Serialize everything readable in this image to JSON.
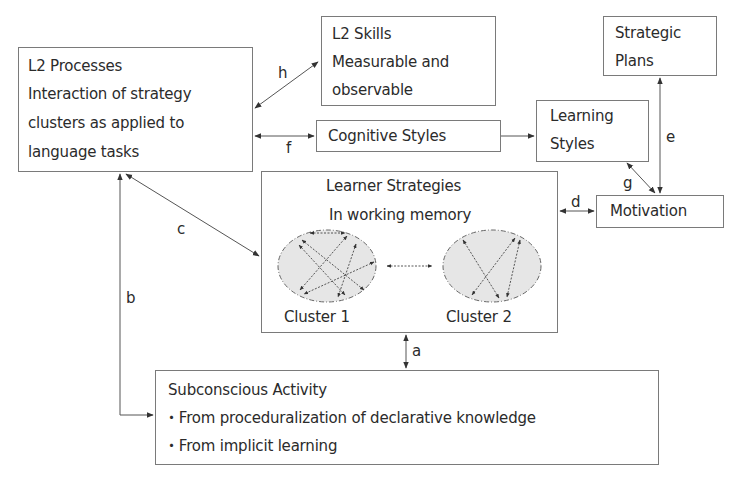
{
  "nodes": {
    "l2_processes": {
      "title": "L2 Processes",
      "lines": [
        "Interaction of strategy",
        "clusters as applied to",
        "language tasks"
      ]
    },
    "l2_skills": {
      "title": "L2 Skills",
      "lines": [
        "Measurable and",
        "observable"
      ]
    },
    "cognitive_styles": {
      "title": "Cognitive Styles"
    },
    "learning_styles": {
      "lines": [
        "Learning",
        "Styles"
      ]
    },
    "strategic_plans": {
      "lines": [
        "Strategic",
        "Plans"
      ]
    },
    "learner_strategies": {
      "title": "Learner Strategies",
      "subtitle": "In working memory",
      "cluster1": "Cluster 1",
      "cluster2": "Cluster 2"
    },
    "motivation": {
      "title": "Motivation"
    },
    "subconscious": {
      "title": "Subconscious Activity",
      "items": [
        "・From proceduralization of declarative knowledge",
        "・From implicit learning"
      ]
    }
  },
  "edge_labels": {
    "a": "a",
    "b": "b",
    "c": "c",
    "d": "d",
    "e": "e",
    "f": "f",
    "g": "g",
    "h": "h"
  },
  "colors": {
    "line": "#555555",
    "border": "#7a7a7a",
    "cluster_fill": "#e6e6e6"
  }
}
